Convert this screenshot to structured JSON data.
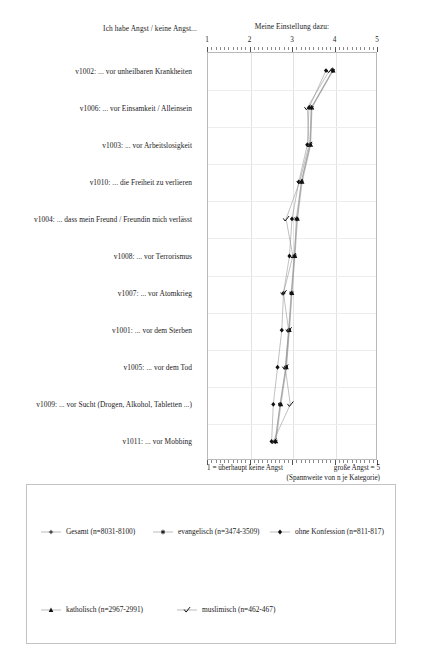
{
  "headers": {
    "left": "Ich habe Angst / keine Angst...",
    "right": "Meine Einstellung dazu:"
  },
  "footer": {
    "left": "1 = überhaupt keine Angst",
    "right": "große Angst = 5",
    "note": "(Spannweite von n je Kategorie)"
  },
  "chart_data": {
    "type": "line",
    "orientation": "horizontal",
    "title": "Meine Einstellung dazu:",
    "xlabel": "1 = überhaupt keine Angst / große Angst = 5",
    "ylabel": "Ich habe Angst / keine Angst...",
    "xlim": [
      1,
      5
    ],
    "xticks": [
      1,
      2,
      3,
      4,
      5
    ],
    "xticklabels": [
      "1",
      "2",
      "3",
      "4",
      "5"
    ],
    "grid": true,
    "legend_position": "below",
    "categories": [
      "v1002: ... vor unheilbaren Krankheiten",
      "v1006: ... vor Einsamkeit / Alleinsein",
      "v1003: ... vor Arbeitslosigkeit",
      "v1010: ... die Freiheit zu verlieren",
      "v1004: ... dass mein Freund / Freundin mich verlässt",
      "v1008: ... vor Terrorismus",
      "v1007: ... vor Atomkrieg",
      "v1001: ... vor dem Sterben",
      "v1005: ... vor dem Tod",
      "v1009: ... vor Sucht (Drogen, Alkohol, Tabletten ...)",
      "v1011: ... vor Mobbing"
    ],
    "series": [
      {
        "name": "Gesamt (n=8031-8100)",
        "marker": "plus",
        "values": [
          3.95,
          3.45,
          3.42,
          3.22,
          3.12,
          3.05,
          2.98,
          2.92,
          2.85,
          2.72,
          2.6
        ]
      },
      {
        "name": "evangelisch (n=3474-3509)",
        "marker": "star",
        "values": [
          3.96,
          3.46,
          3.43,
          3.22,
          3.1,
          3.06,
          2.99,
          2.93,
          2.86,
          2.72,
          2.61
        ]
      },
      {
        "name": "ohne Konfession (n=811-817)",
        "marker": "diamond",
        "values": [
          3.8,
          3.4,
          3.36,
          3.16,
          3.0,
          2.94,
          2.8,
          2.76,
          2.66,
          2.56,
          2.52
        ]
      },
      {
        "name": "katholisch (n=2967-2991)",
        "marker": "triangle",
        "values": [
          3.97,
          3.47,
          3.44,
          3.24,
          3.13,
          3.07,
          3.0,
          2.94,
          2.87,
          2.74,
          2.62
        ]
      },
      {
        "name": "muslimisch (n=462-467)",
        "marker": "check",
        "values": [
          3.88,
          3.36,
          3.4,
          3.18,
          2.86,
          3.02,
          2.8,
          2.92,
          2.84,
          2.96,
          2.56
        ]
      }
    ]
  },
  "legend": {
    "row1": [
      {
        "label": "Gesamt (n=8031-8100)",
        "marker": "plus"
      },
      {
        "label": "evangelisch (n=3474-3509)",
        "marker": "star"
      },
      {
        "label": "ohne Konfession (n=811-817)",
        "marker": "diamond"
      }
    ],
    "row2": [
      {
        "label": "katholisch (n=2967-2991)",
        "marker": "triangle"
      },
      {
        "label": "muslimisch (n=462-467)",
        "marker": "check"
      }
    ]
  }
}
